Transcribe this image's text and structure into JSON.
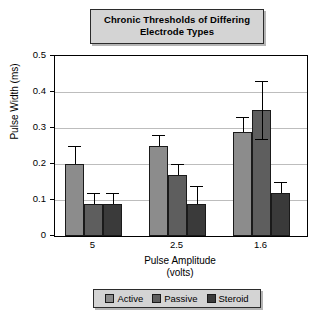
{
  "chart_data": {
    "type": "bar",
    "title": "Chronic Thresholds of Differing Electrode Types",
    "title_lines": [
      "Chronic Thresholds of Differing",
      "Electrode Types"
    ],
    "xlabel": "Pulse Amplitude",
    "xlabel_sub": "(volts)",
    "ylabel": "Pulse Width (ms)",
    "categories": [
      "5",
      "2.5",
      "1.6"
    ],
    "ylim": [
      0,
      0.5
    ],
    "yticks": [
      0,
      0.1,
      0.2,
      0.3,
      0.4,
      0.5
    ],
    "ytick_labels": [
      "0",
      "0.1",
      "0.2",
      "0.3",
      "0.4",
      "0.5"
    ],
    "grid": true,
    "legend_position": "bottom",
    "series": [
      {
        "name": "Active",
        "color": "#8c8c8c",
        "values": [
          0.2,
          0.25,
          0.29
        ],
        "errors_upper": [
          0.25,
          0.28,
          0.33
        ],
        "errors_lower": [
          0.2,
          0.25,
          0.29
        ]
      },
      {
        "name": "Passive",
        "color": "#5e5e5e",
        "values": [
          0.09,
          0.17,
          0.35
        ],
        "errors_upper": [
          0.12,
          0.2,
          0.43
        ],
        "errors_lower": [
          0.09,
          0.17,
          0.27
        ]
      },
      {
        "name": "Steroid",
        "color": "#3a3a3a",
        "values": [
          0.09,
          0.09,
          0.12
        ],
        "errors_upper": [
          0.12,
          0.14,
          0.15
        ],
        "errors_lower": [
          0.09,
          0.09,
          0.12
        ]
      }
    ]
  },
  "legend": {
    "items": [
      {
        "label": "Active",
        "color": "#8c8c8c"
      },
      {
        "label": "Passive",
        "color": "#5e5e5e"
      },
      {
        "label": "Steroid",
        "color": "#3a3a3a"
      }
    ]
  }
}
